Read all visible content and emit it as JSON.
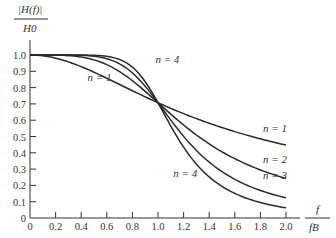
{
  "chart_data": {
    "type": "line",
    "title": "",
    "ylabel_num": "|H(f)|",
    "ylabel_den": "H0",
    "xlabel_num": "f",
    "xlabel_den": "fB",
    "xlim": [
      0,
      2.0
    ],
    "ylim": [
      0,
      1.0
    ],
    "grid": false,
    "x_ticks": [
      "0",
      "0.2",
      "0.4",
      "0.6",
      "0.8",
      "1.0",
      "1.2",
      "1.4",
      "1.6",
      "1.8",
      "2.0"
    ],
    "y_ticks": [
      "0",
      "0.1",
      "0.2",
      "0.3",
      "0.4",
      "0.5",
      "0.6",
      "0.7",
      "0.8",
      "0.9",
      "1.0"
    ],
    "x": [
      0,
      0.2,
      0.4,
      0.6,
      0.8,
      1.0,
      1.2,
      1.4,
      1.6,
      1.8,
      2.0
    ],
    "series": [
      {
        "name": "n = 1",
        "values": [
          1.0,
          0.98,
          0.93,
          0.86,
          0.78,
          0.71,
          0.64,
          0.58,
          0.53,
          0.49,
          0.45
        ]
      },
      {
        "name": "n = 2",
        "values": [
          1.0,
          1.0,
          0.99,
          0.94,
          0.84,
          0.71,
          0.57,
          0.45,
          0.36,
          0.3,
          0.24
        ]
      },
      {
        "name": "n = 3",
        "values": [
          1.0,
          1.0,
          1.0,
          0.98,
          0.89,
          0.71,
          0.5,
          0.34,
          0.24,
          0.17,
          0.12
        ]
      },
      {
        "name": "n = 4",
        "values": [
          1.0,
          1.0,
          1.0,
          0.99,
          0.93,
          0.71,
          0.43,
          0.25,
          0.15,
          0.09,
          0.06
        ]
      }
    ],
    "annotations": [
      {
        "text": "n = 4",
        "x": 0.98,
        "y": 0.95
      },
      {
        "text": "n = 1",
        "x": 0.45,
        "y": 0.84
      },
      {
        "text": "n = 1",
        "x": 1.82,
        "y": 0.53
      },
      {
        "text": "n = 2",
        "x": 1.82,
        "y": 0.34
      },
      {
        "text": "n = 3",
        "x": 1.82,
        "y": 0.24
      },
      {
        "text": "n = 4",
        "x": 1.12,
        "y": 0.25
      }
    ]
  }
}
